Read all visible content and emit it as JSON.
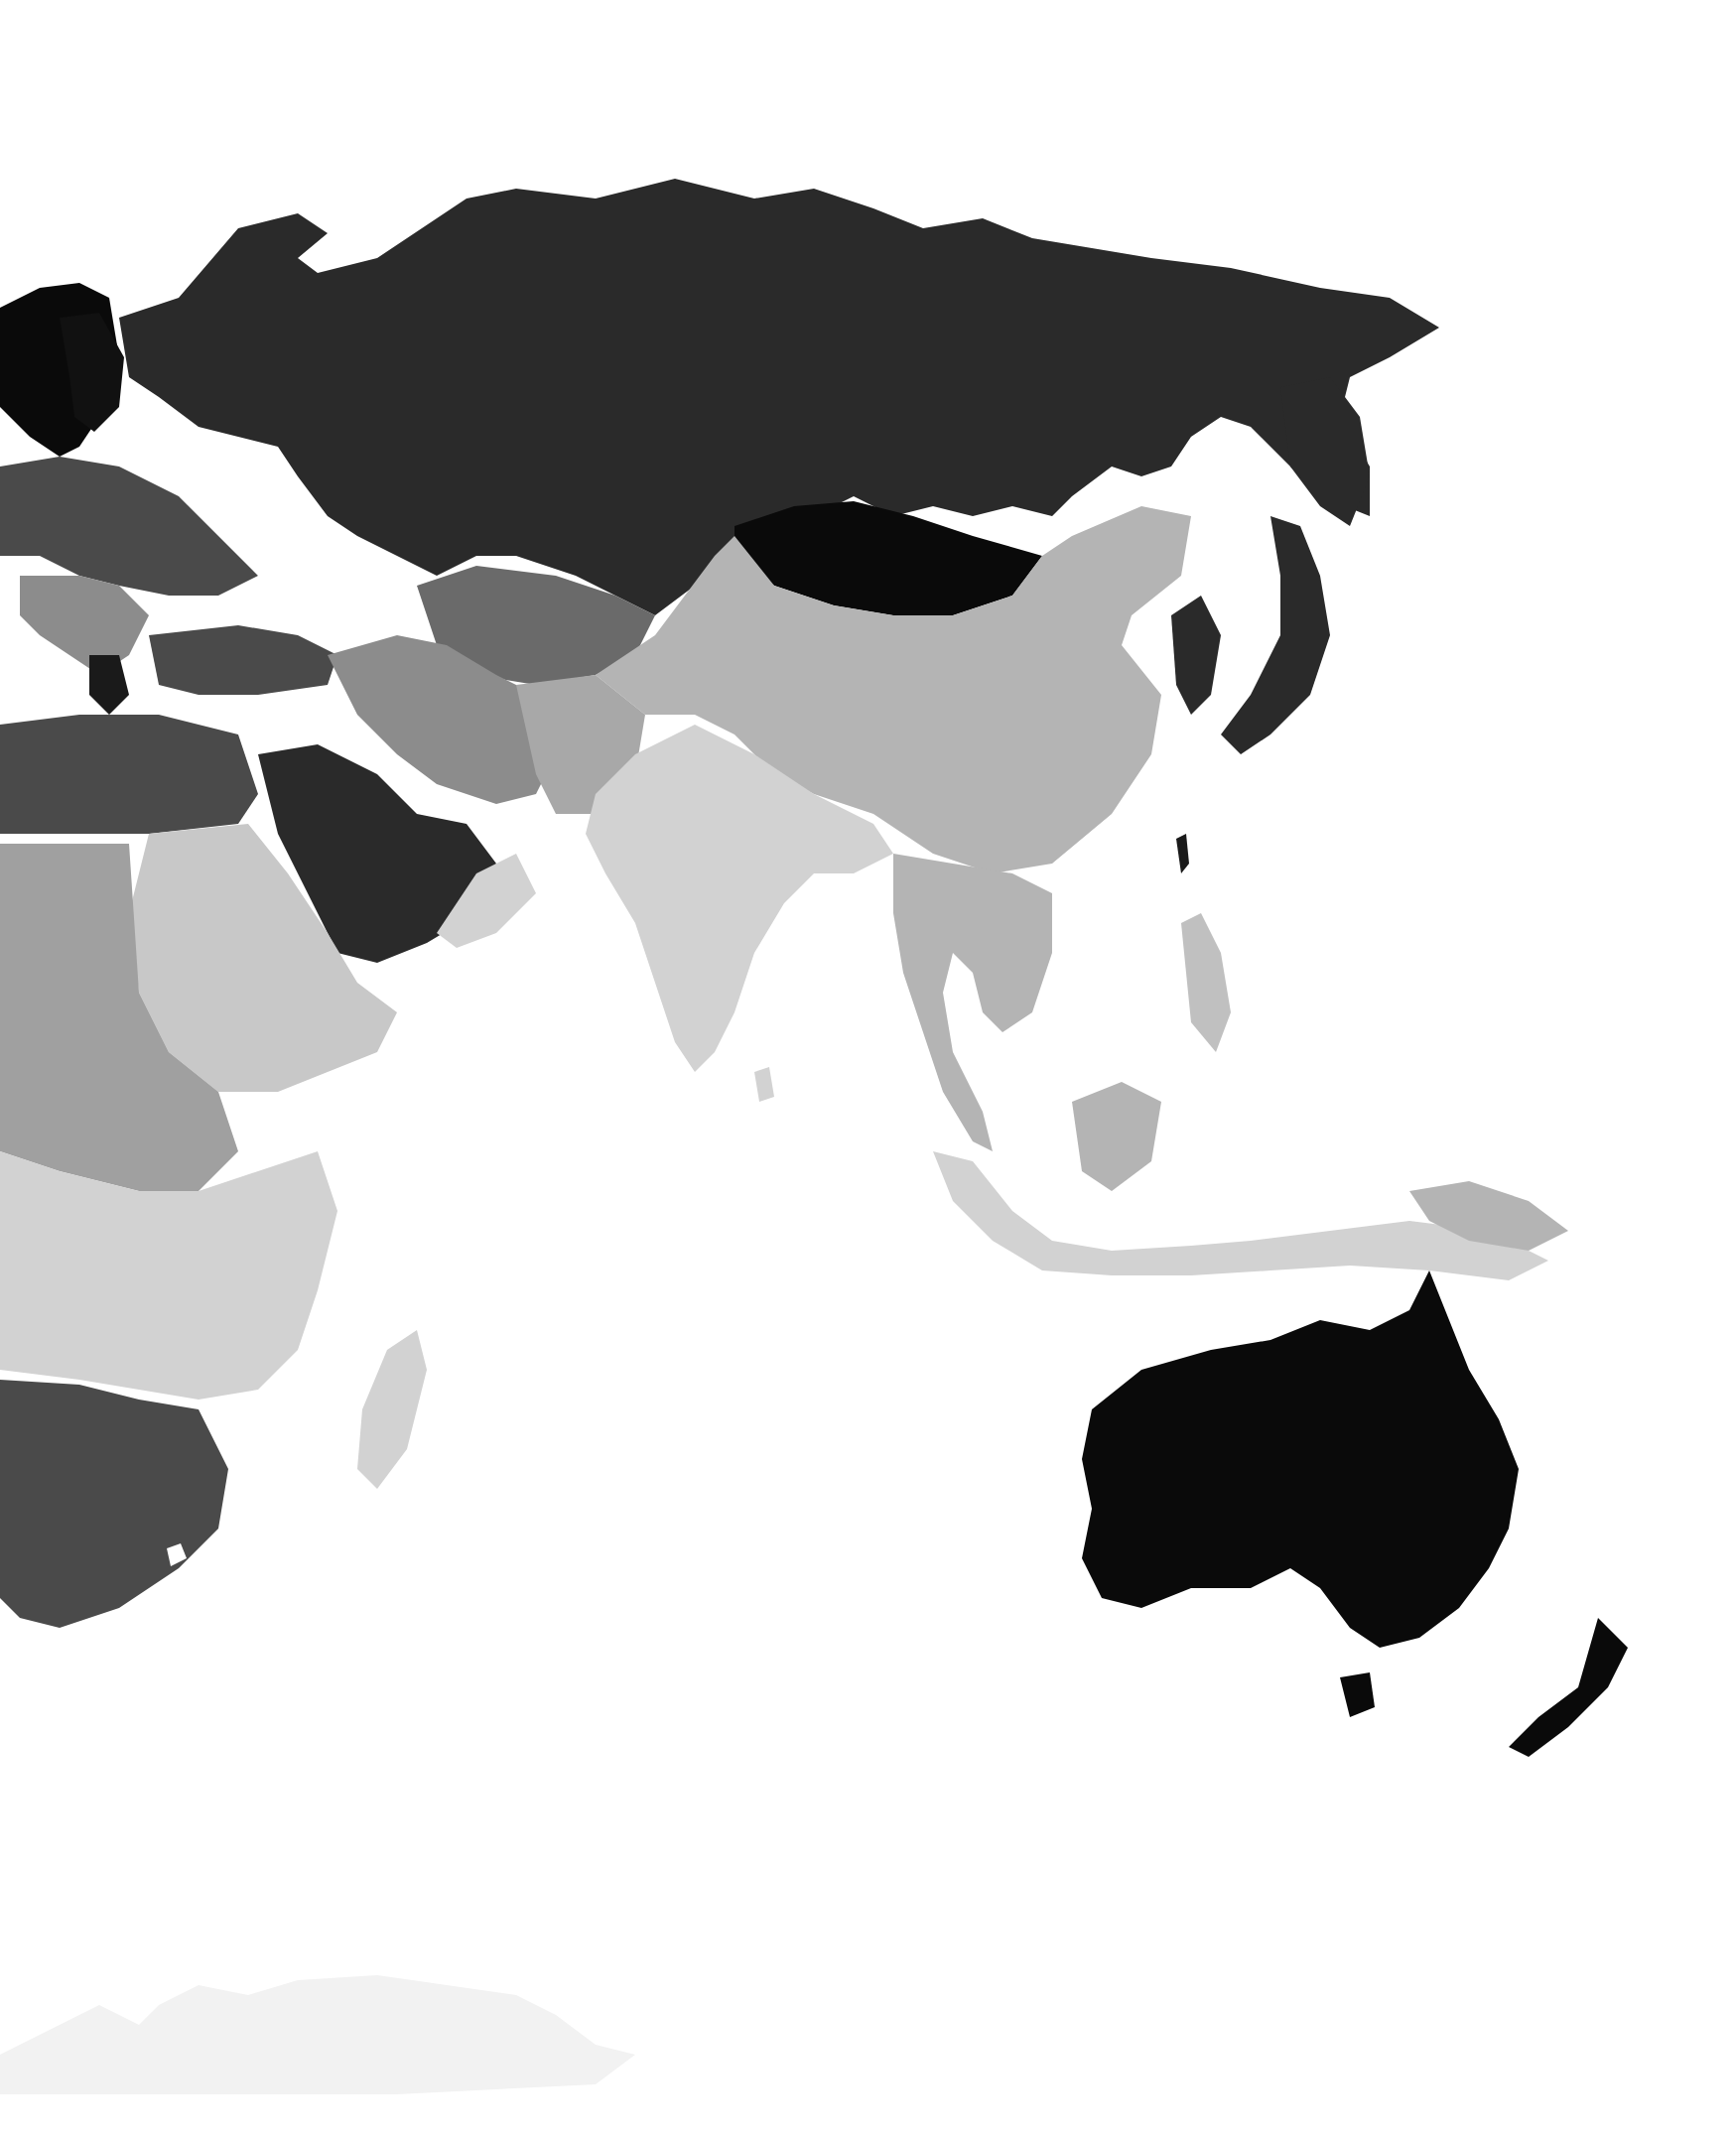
{
  "map": {
    "type": "grayscale choropleth world map (Eastern Hemisphere: Europe, Africa, Asia, Oceania)",
    "background": "#ffffff",
    "shades": {
      "black": "#0a0a0a",
      "very_dark": "#2a2a2a",
      "dark": "#4a4a4a",
      "mid_dark": "#6a6a6a",
      "mid": "#8c8c8c",
      "light": "#b4b4b4",
      "very_light": "#d2d2d2",
      "faint": "#f2f2f2"
    },
    "regions": [
      {
        "name": "Scandinavia",
        "shade": "black"
      },
      {
        "name": "Russia",
        "shade": "very_dark"
      },
      {
        "name": "Eastern Europe",
        "shade": "dark"
      },
      {
        "name": "Balkans",
        "shade": "mid"
      },
      {
        "name": "Turkey",
        "shade": "dark"
      },
      {
        "name": "Kazakhstan / Central Asia",
        "shade": "mid_dark"
      },
      {
        "name": "Mongolia",
        "shade": "black"
      },
      {
        "name": "China",
        "shade": "light"
      },
      {
        "name": "Iran",
        "shade": "mid"
      },
      {
        "name": "Afghanistan / Pakistan",
        "shade": "light"
      },
      {
        "name": "India",
        "shade": "very_light"
      },
      {
        "name": "Arabian Peninsula",
        "shade": "very_dark"
      },
      {
        "name": "Egypt / Libya",
        "shade": "dark"
      },
      {
        "name": "Sudan / Horn of Africa",
        "shade": "very_light"
      },
      {
        "name": "Central Africa",
        "shade": "light"
      },
      {
        "name": "East Africa",
        "shade": "very_light"
      },
      {
        "name": "Southern Africa",
        "shade": "dark"
      },
      {
        "name": "Madagascar",
        "shade": "very_light"
      },
      {
        "name": "Southeast Asia",
        "shade": "light"
      },
      {
        "name": "Indonesia",
        "shade": "very_light"
      },
      {
        "name": "Korea / Japan",
        "shade": "very_dark"
      },
      {
        "name": "Australia",
        "shade": "black"
      },
      {
        "name": "New Zealand",
        "shade": "black"
      },
      {
        "name": "Antarctica",
        "shade": "faint"
      }
    ]
  }
}
